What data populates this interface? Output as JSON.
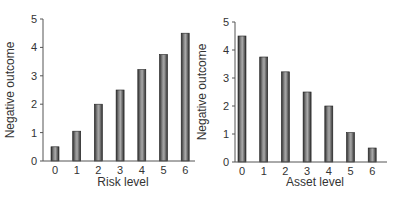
{
  "chart_data": [
    {
      "type": "bar",
      "title": "",
      "xlabel": "Risk level",
      "ylabel": "Negative outcome",
      "categories": [
        "0",
        "1",
        "2",
        "3",
        "4",
        "5",
        "6"
      ],
      "values": [
        0.5,
        1.05,
        2.0,
        2.5,
        3.22,
        3.75,
        4.5
      ],
      "ylim": [
        0,
        5
      ],
      "yticks": [
        "0",
        "1",
        "2",
        "3",
        "4",
        "5"
      ],
      "grid": false,
      "legend": null
    },
    {
      "type": "bar",
      "title": "",
      "xlabel": "Asset level",
      "ylabel": "Negative outcome",
      "categories": [
        "0",
        "1",
        "2",
        "3",
        "4",
        "5",
        "6"
      ],
      "values": [
        4.5,
        3.75,
        3.22,
        2.5,
        2.0,
        1.05,
        0.5
      ],
      "ylim": [
        0,
        5
      ],
      "yticks": [
        "0",
        "1",
        "2",
        "3",
        "4",
        "5"
      ],
      "grid": false,
      "legend": null
    }
  ],
  "colors": {
    "bar_fill_dark": "#3a3a3a",
    "bar_fill_light": "#9a9a9a",
    "axis": "#555555",
    "text": "#333333"
  }
}
